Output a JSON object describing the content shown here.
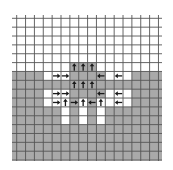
{
  "diagram": {
    "title": "",
    "grid": {
      "cols": 16,
      "rows": 16
    },
    "colors": {
      "background": "#ffffff",
      "filled_cell": "#a9a9a9",
      "empty_cell": "#ffffff",
      "grid_line": "#555555",
      "arrow": "#1a1a1a"
    },
    "filled_rows_from": 6,
    "extra_filled_cells": [
      [
        6,
        5
      ],
      [
        7,
        5
      ],
      [
        8,
        5
      ]
    ],
    "empty_cells_in_filled_region": [
      [
        3,
        6
      ],
      [
        4,
        6
      ],
      [
        5,
        6
      ],
      [
        10,
        6
      ],
      [
        11,
        6
      ],
      [
        12,
        6
      ],
      [
        3,
        8
      ],
      [
        4,
        8
      ],
      [
        5,
        8
      ],
      [
        10,
        8
      ],
      [
        11,
        8
      ],
      [
        12,
        8
      ],
      [
        3,
        9
      ],
      [
        4,
        9
      ],
      [
        5,
        9
      ],
      [
        7,
        9
      ],
      [
        9,
        9
      ],
      [
        10,
        9
      ],
      [
        11,
        9
      ],
      [
        12,
        9
      ],
      [
        5,
        10
      ],
      [
        7,
        10
      ],
      [
        9,
        10
      ],
      [
        5,
        11
      ],
      [
        7,
        11
      ],
      [
        9,
        11
      ]
    ],
    "arrows": [
      {
        "col": 6,
        "row": 5,
        "dir": "up"
      },
      {
        "col": 7,
        "row": 5,
        "dir": "up"
      },
      {
        "col": 8,
        "row": 5,
        "dir": "up"
      },
      {
        "col": 4,
        "row": 6,
        "dir": "right"
      },
      {
        "col": 5,
        "row": 6,
        "dir": "right"
      },
      {
        "col": 9,
        "row": 6,
        "dir": "left"
      },
      {
        "col": 11,
        "row": 6,
        "dir": "left"
      },
      {
        "col": 6,
        "row": 7,
        "dir": "up"
      },
      {
        "col": 7,
        "row": 7,
        "dir": "up"
      },
      {
        "col": 8,
        "row": 7,
        "dir": "up"
      },
      {
        "col": 4,
        "row": 8,
        "dir": "right"
      },
      {
        "col": 5,
        "row": 8,
        "dir": "right"
      },
      {
        "col": 9,
        "row": 8,
        "dir": "left"
      },
      {
        "col": 11,
        "row": 8,
        "dir": "left"
      },
      {
        "col": 4,
        "row": 9,
        "dir": "right"
      },
      {
        "col": 5,
        "row": 9,
        "dir": "up"
      },
      {
        "col": 6,
        "row": 9,
        "dir": "right"
      },
      {
        "col": 7,
        "row": 9,
        "dir": "up"
      },
      {
        "col": 8,
        "row": 9,
        "dir": "left"
      },
      {
        "col": 9,
        "row": 9,
        "dir": "up"
      },
      {
        "col": 11,
        "row": 9,
        "dir": "left"
      }
    ]
  }
}
